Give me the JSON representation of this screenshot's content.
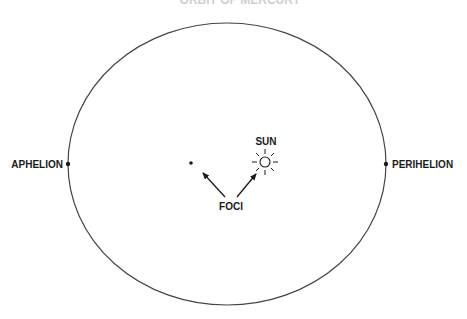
{
  "diagram": {
    "title_fragment": "ORBIT OF MERCURY",
    "labels": {
      "aphelion": "APHELION",
      "perihelion": "PERIHELION",
      "sun": "SUN",
      "foci": "FOCI"
    },
    "colors": {
      "line": "#333333",
      "text": "#1a1a1a",
      "background": "#ffffff"
    }
  }
}
